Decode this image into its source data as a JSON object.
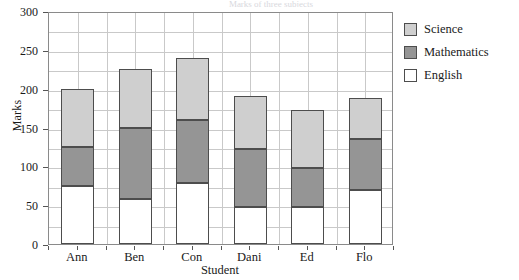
{
  "figure": {
    "title_remnant": "Marks of three subjects",
    "ylabel": "Marks",
    "xlabel": "Student"
  },
  "axis": {
    "y_ticks": [
      "300",
      "250",
      "200",
      "150",
      "100",
      "50",
      "0"
    ],
    "x_ticks": [
      "Ann",
      "Ben",
      "Con",
      "Dani",
      "Ed",
      "Flo"
    ]
  },
  "legend": {
    "items": [
      {
        "label": "Science",
        "color": "#cfcfcf"
      },
      {
        "label": "Mathematics",
        "color": "#959595"
      },
      {
        "label": "English",
        "color": "#ffffff"
      }
    ]
  },
  "chart_data": {
    "type": "bar",
    "subtype": "stacked-vertical",
    "title": "Marks of three subjects",
    "xlabel": "Student",
    "ylabel": "Marks",
    "ylim": [
      0,
      300
    ],
    "y_tick_step": 50,
    "y_gridline_step": 25,
    "grid": true,
    "legend_position": "right",
    "categories": [
      "Ann",
      "Ben",
      "Con",
      "Dani",
      "Ed",
      "Flo"
    ],
    "series": [
      {
        "name": "English",
        "color": "#ffffff",
        "values": [
          75,
          58,
          78,
          47,
          47,
          70
        ]
      },
      {
        "name": "Mathematics",
        "color": "#959595",
        "values": [
          50,
          92,
          82,
          75,
          51,
          65
        ]
      },
      {
        "name": "Science",
        "color": "#cfcfcf",
        "values": [
          75,
          75,
          80,
          68,
          75,
          53
        ]
      }
    ],
    "stack_tops": {
      "English": [
        75,
        58,
        78,
        47,
        47,
        70
      ],
      "Mathematics": [
        125,
        150,
        160,
        122,
        98,
        135
      ],
      "Science": [
        200,
        225,
        240,
        190,
        173,
        188
      ]
    },
    "totals": [
      200,
      225,
      240,
      190,
      173,
      188
    ]
  }
}
